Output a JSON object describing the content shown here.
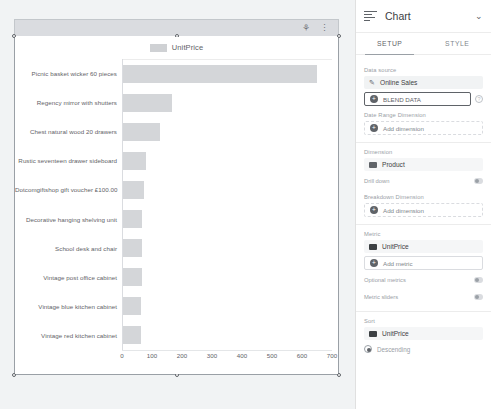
{
  "canvas": {
    "toolbar": {
      "icons": [
        "filter-icon",
        "more-vert-icon"
      ]
    }
  },
  "chart_data": {
    "type": "bar",
    "orientation": "horizontal",
    "title": "",
    "legend": {
      "position": "top",
      "entries": [
        "UnitPrice"
      ]
    },
    "series_name": "UnitPrice",
    "xlabel": "",
    "ylabel": "",
    "xlim": [
      0,
      700
    ],
    "xticks": [
      0,
      100,
      200,
      300,
      400,
      500,
      600,
      700
    ],
    "grid": false,
    "bar_color": "#d4d6d9",
    "categories": [
      "Picnic basket wicker 60 pieces",
      "Regency mirror with shutters",
      "Chest natural wood 20 drawers",
      "Rustic seventeen drawer sideboard",
      "Dotcomgiftshop gift voucher £100.00",
      "Decorative hanging shelving unit",
      "School desk and chair",
      "Vintage post office cabinet",
      "Vintage blue kitchen cabinet",
      "Vintage red kitchen cabinet"
    ],
    "values": [
      650,
      165,
      125,
      80,
      72,
      66,
      66,
      65,
      63,
      63
    ]
  },
  "panel": {
    "header": {
      "title": "Chart",
      "icon": "bar-chart-icon",
      "collapse_icon": "chevron-down-icon"
    },
    "tabs": [
      {
        "label": "SETUP",
        "active": true
      },
      {
        "label": "STYLE",
        "active": false
      }
    ],
    "data_source": {
      "label": "Data source",
      "name": "Online Sales",
      "blend_button": "BLEND DATA",
      "help_icon": "help-icon"
    },
    "date_range": {
      "label": "Date Range Dimension",
      "add_button": "Add dimension"
    },
    "dimension": {
      "label": "Dimension",
      "field": "Product",
      "drill_down_label": "Drill down",
      "breakdown_label": "Breakdown Dimension",
      "add_button": "Add dimension"
    },
    "metric": {
      "label": "Metric",
      "field": "UnitPrice",
      "add_button": "Add metric",
      "optional_metrics_label": "Optional metrics",
      "metric_sliders_label": "Metric sliders"
    },
    "sort": {
      "label": "Sort",
      "field": "UnitPrice",
      "direction": "Descending"
    }
  }
}
